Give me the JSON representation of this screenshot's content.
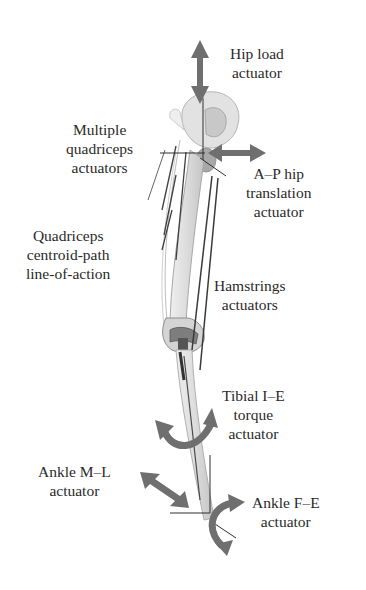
{
  "diagram": {
    "type": "knee-simulator-leg-actuators",
    "colors": {
      "arrow": "#6f6f6f",
      "bone": "#d8d8d8",
      "bone_outline": "#9a9a9a",
      "line": "#3a3a3a",
      "text": "#2a2a2a",
      "background": "#ffffff"
    },
    "labels": {
      "hip_load": {
        "line1": "Hip load",
        "line2": "actuator"
      },
      "multiple_quads": {
        "line1": "Multiple",
        "line2": "quadriceps",
        "line3": "actuators"
      },
      "ap_hip": {
        "line1": "A–P hip",
        "line2": "translation",
        "line3": "actuator"
      },
      "quad_centroid": {
        "line1": "Quadriceps",
        "line2": "centroid-path",
        "line3": "line-of-action"
      },
      "hamstrings": {
        "line1": "Hamstrings",
        "line2": "actuators"
      },
      "tibial_ie": {
        "line1": "Tibial I–E",
        "line2": "torque",
        "line3": "actuator"
      },
      "ankle_ml": {
        "line1": "Ankle M–L",
        "line2": "actuator"
      },
      "ankle_fe": {
        "line1": "Ankle F–E",
        "line2": "actuator"
      }
    }
  }
}
